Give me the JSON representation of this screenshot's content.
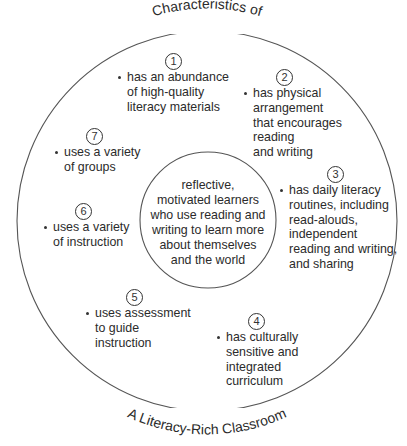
{
  "title": {
    "top_arc": "Characteristics of",
    "bottom_arc": "A Literacy-Rich Classroom"
  },
  "center": {
    "lines": [
      "reflective,",
      "motivated learners",
      "who use reading and",
      "writing to learn more",
      "about themselves",
      "and the world"
    ]
  },
  "characteristics": [
    {
      "number": "1",
      "lines": [
        "has an abundance",
        "of high-quality",
        "literacy materials"
      ]
    },
    {
      "number": "2",
      "lines": [
        "has physical",
        "arrangement",
        "that encourages",
        "reading",
        "and writing"
      ]
    },
    {
      "number": "3",
      "lines": [
        "has daily literacy",
        "routines, including",
        "read-alouds,",
        "independent",
        "reading and writing,",
        "and sharing"
      ]
    },
    {
      "number": "4",
      "lines": [
        "has culturally",
        "sensitive and",
        "integrated",
        "curriculum"
      ]
    },
    {
      "number": "5",
      "lines": [
        "uses assessment",
        "to guide",
        "instruction"
      ]
    },
    {
      "number": "6",
      "lines": [
        "uses a variety",
        "of instruction"
      ]
    },
    {
      "number": "7",
      "lines": [
        "uses a variety",
        "of groups"
      ]
    }
  ],
  "colors": {
    "stroke": "#555555",
    "text": "#2b2b2b",
    "background": "#ffffff"
  }
}
